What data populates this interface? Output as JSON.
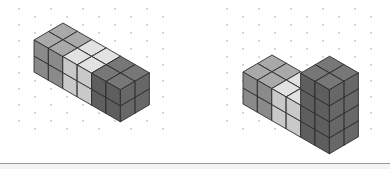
{
  "figures": [
    {
      "id": "figure-left",
      "origin": [
        34,
        40
      ],
      "length": 6,
      "depth": 2,
      "columns": [
        {
          "height": 2,
          "shade": "medium"
        },
        {
          "height": 2,
          "shade": "medium"
        },
        {
          "height": 2,
          "shade": "light"
        },
        {
          "height": 2,
          "shade": "light"
        },
        {
          "height": 2,
          "shade": "dark"
        },
        {
          "height": 2,
          "shade": "dark"
        }
      ]
    },
    {
      "id": "figure-right",
      "origin": [
        243,
        72
      ],
      "length": 6,
      "depth": 2,
      "columns": [
        {
          "height": 2,
          "shade": "medium"
        },
        {
          "height": 2,
          "shade": "medium"
        },
        {
          "height": 2,
          "shade": "light"
        },
        {
          "height": 2,
          "shade": "light"
        },
        {
          "height": 4,
          "shade": "dark"
        },
        {
          "height": 4,
          "shade": "dark"
        }
      ]
    }
  ],
  "geometry": {
    "length_vector": [
      14.4,
      8.3
    ],
    "depth_vector": [
      14.5,
      -8.5
    ],
    "height_unit": 16
  },
  "colors": {
    "medium": {
      "top": "#a9a9a9",
      "left": "#8a8a8a",
      "right": "#7d7d7d"
    },
    "light": {
      "top": "#e2e2e2",
      "left": "#c9c9c9",
      "right": "#bdbdbd"
    },
    "dark": {
      "top": "#777777",
      "left": "#5e5e5e",
      "right": "#676767"
    },
    "edge": "#2f2f2f",
    "dot": "#c4c4c4",
    "separator": "#9a9a9a"
  },
  "dot_grid": {
    "panels": [
      {
        "x_start": 19,
        "x_end": 165,
        "y_start": 9,
        "y_end": 135
      },
      {
        "x_start": 227,
        "x_end": 375,
        "y_start": 9,
        "y_end": 135
      }
    ],
    "dx": 16,
    "dy": 8
  }
}
